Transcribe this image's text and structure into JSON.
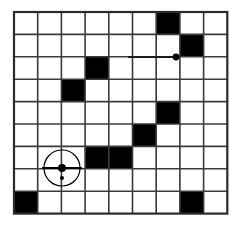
{
  "figure": {
    "title": "",
    "kind": "grid-puzzle-diagram",
    "background_color": "#ffffff",
    "line_color": "#3a3a3a",
    "filled_color": "#000000",
    "empty_color": "#ffffff",
    "border_color": "#2b2b2b"
  },
  "grid": {
    "rows": 9,
    "cols": 9,
    "origin_x": 14,
    "origin_y": 12,
    "cell_width": 23.7,
    "cell_height": 22.4,
    "line_width": 1.6,
    "border_width": 2.2,
    "filled_cells": [
      {
        "row": 0,
        "col": 6
      },
      {
        "row": 1,
        "col": 7
      },
      {
        "row": 2,
        "col": 3
      },
      {
        "row": 3,
        "col": 2
      },
      {
        "row": 4,
        "col": 6
      },
      {
        "row": 5,
        "col": 5
      },
      {
        "row": 6,
        "col": 3
      },
      {
        "row": 6,
        "col": 4
      },
      {
        "row": 8,
        "col": 0
      },
      {
        "row": 8,
        "col": 7
      }
    ],
    "filled_count": 10,
    "empty_count": 71
  },
  "markers": {
    "anchor_dot": {
      "name": "anchor-point",
      "row_line": 2,
      "col_line": 6,
      "x": 176,
      "y": 57,
      "radius": 3.4,
      "color": "#000000"
    },
    "lead_line": {
      "name": "anchor-lead-line",
      "x1": 128,
      "x2": 176,
      "y": 57,
      "width": 2.0,
      "color": "#1a1a1a"
    }
  },
  "cursor": {
    "name": "crosshair-cursor",
    "x": 62,
    "y": 168,
    "circle_radius": 18,
    "circle_width": 1.2,
    "center_dot_radius": 4.0,
    "secondary_dot": {
      "dx": 0,
      "dy": 10,
      "radius": 2.0
    },
    "color": "#000000",
    "crosshair_arm": 20
  },
  "labels": {
    "figure_caption": "",
    "alt": "9 by 9 grid with ten filled black squares, a crosshair cursor and an anchor dot"
  }
}
